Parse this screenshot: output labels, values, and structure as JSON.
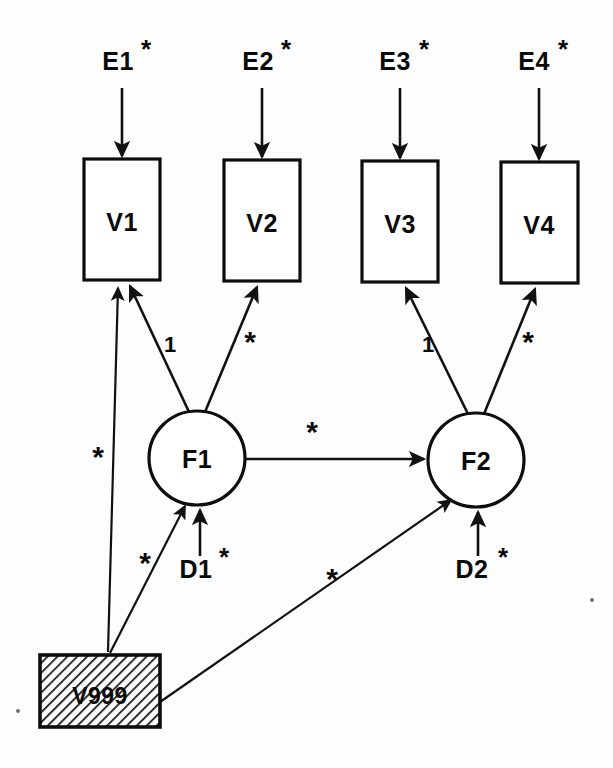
{
  "diagram": {
    "type": "structural-equation-model-path-diagram",
    "title": "",
    "background_color": "#fdfdfd",
    "line_color": "#111111",
    "shaded_fill": "hatched-diagonal",
    "measured_variables": [
      {
        "id": "V1",
        "label": "V1",
        "x": 84,
        "y": 159,
        "w": 76,
        "h": 121
      },
      {
        "id": "V2",
        "label": "V2",
        "x": 224,
        "y": 160,
        "w": 76,
        "h": 121
      },
      {
        "id": "V3",
        "label": "V3",
        "x": 362,
        "y": 161,
        "w": 76,
        "h": 121
      },
      {
        "id": "V4",
        "label": "V4",
        "x": 501,
        "y": 162,
        "w": 77,
        "h": 121
      }
    ],
    "latent_factors": [
      {
        "id": "F1",
        "label": "F1",
        "cx": 197,
        "cy": 458,
        "rx": 48,
        "ry": 47
      },
      {
        "id": "F2",
        "label": "F2",
        "cx": 476,
        "cy": 460,
        "rx": 48,
        "ry": 47
      }
    ],
    "error_terms": [
      {
        "id": "E1",
        "label": "E1",
        "star": "*",
        "x": 122,
        "y": 70
      },
      {
        "id": "E2",
        "label": "E2",
        "star": "*",
        "x": 262,
        "y": 70
      },
      {
        "id": "E3",
        "label": "E3",
        "star": "*",
        "x": 400,
        "y": 70
      },
      {
        "id": "E4",
        "label": "E4",
        "star": "*",
        "x": 539,
        "y": 70
      }
    ],
    "disturbance_terms": [
      {
        "id": "D1",
        "label": "D1",
        "star": "*",
        "x": 200,
        "y": 578
      },
      {
        "id": "D2",
        "label": "D2",
        "star": "*",
        "x": 478,
        "y": 578
      }
    ],
    "constant_node": {
      "id": "V999",
      "label": "V999",
      "x": 40,
      "y": 655,
      "w": 120,
      "h": 72,
      "shaded": true
    },
    "paths": [
      {
        "from": "E1",
        "to": "V1",
        "label": "",
        "kind": "error-to-indicator"
      },
      {
        "from": "E2",
        "to": "V2",
        "label": "",
        "kind": "error-to-indicator"
      },
      {
        "from": "E3",
        "to": "V3",
        "label": "",
        "kind": "error-to-indicator"
      },
      {
        "from": "E4",
        "to": "V4",
        "label": "",
        "kind": "error-to-indicator"
      },
      {
        "from": "F1",
        "to": "V1",
        "label": "1",
        "kind": "factor-loading"
      },
      {
        "from": "F1",
        "to": "V2",
        "label": "*",
        "kind": "factor-loading"
      },
      {
        "from": "F2",
        "to": "V3",
        "label": "1",
        "kind": "factor-loading"
      },
      {
        "from": "F2",
        "to": "V4",
        "label": "*",
        "kind": "factor-loading"
      },
      {
        "from": "F1",
        "to": "F2",
        "label": "*",
        "kind": "structural-regression"
      },
      {
        "from": "D1",
        "to": "F1",
        "label": "",
        "kind": "disturbance-to-factor"
      },
      {
        "from": "D2",
        "to": "F2",
        "label": "",
        "kind": "disturbance-to-factor"
      },
      {
        "from": "V999",
        "to": "V1",
        "label": "*",
        "kind": "intercept-to-indicator"
      },
      {
        "from": "V999",
        "to": "F1",
        "label": "*",
        "kind": "intercept-to-factor"
      },
      {
        "from": "V999",
        "to": "F2",
        "label": "*",
        "kind": "intercept-to-factor"
      }
    ],
    "path_labels": [
      {
        "id": "load-v1",
        "text": "1",
        "x": 170,
        "y": 352
      },
      {
        "id": "load-v2",
        "text": "*",
        "x": 250,
        "y": 352
      },
      {
        "id": "load-v3",
        "text": "1",
        "x": 428,
        "y": 352
      },
      {
        "id": "load-v4",
        "text": "*",
        "x": 528,
        "y": 352
      },
      {
        "id": "f1-f2",
        "text": "*",
        "x": 312,
        "y": 442
      },
      {
        "id": "v999-v1",
        "text": "*",
        "x": 98,
        "y": 467
      },
      {
        "id": "v999-f1",
        "text": "*",
        "x": 145,
        "y": 573
      },
      {
        "id": "v999-f2",
        "text": "*",
        "x": 332,
        "y": 589
      }
    ]
  }
}
